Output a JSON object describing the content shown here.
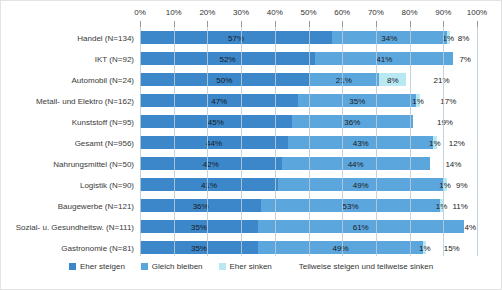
{
  "chart_data": {
    "type": "bar",
    "orientation": "horizontal",
    "stacked": true,
    "unit": "%",
    "xlim": [
      0,
      100
    ],
    "x_ticks": [
      "0%",
      "10%",
      "20%",
      "30%",
      "40%",
      "50%",
      "60%",
      "70%",
      "80%",
      "90%",
      "100%"
    ],
    "grid": true,
    "legend_position": "bottom",
    "categories": [
      "Handel (N=134)",
      "IKT (N=92)",
      "Automobil (N=24)",
      "Metall- und Elektro (N=162)",
      "Kunststoff (N=95)",
      "Gesamt (N=956)",
      "Nahrungsmittel (N=50)",
      "Logistik (N=90)",
      "Baugewerbe (N=121)",
      "Sozial- u. Gesundheitsw. (N=111)",
      "Gastronomie (N=81)"
    ],
    "series": [
      {
        "name": "Eher steigen",
        "color": "#3b87ca",
        "values": [
          57,
          52,
          50,
          47,
          45,
          44,
          42,
          41,
          36,
          35,
          35
        ]
      },
      {
        "name": "Gleich bleiben",
        "color": "#5ca6de",
        "values": [
          34,
          41,
          21,
          35,
          36,
          43,
          44,
          49,
          53,
          61,
          49
        ]
      },
      {
        "name": "Eher sinken",
        "color": "#b8e8f2",
        "values": [
          1,
          0,
          8,
          1,
          0,
          1,
          0,
          1,
          1,
          0,
          1
        ]
      },
      {
        "name": "Teilweise steigen und teilweise sinken",
        "color": "#ffffff",
        "values": [
          8,
          7,
          21,
          17,
          19,
          12,
          14,
          9,
          11,
          4,
          15
        ]
      }
    ],
    "data_label_format": "{value}%"
  },
  "colors": {
    "gridline": "rgba(186,203,215,0.85)",
    "axis_text": "#333333",
    "data_label_text": "#1a1a1a"
  }
}
